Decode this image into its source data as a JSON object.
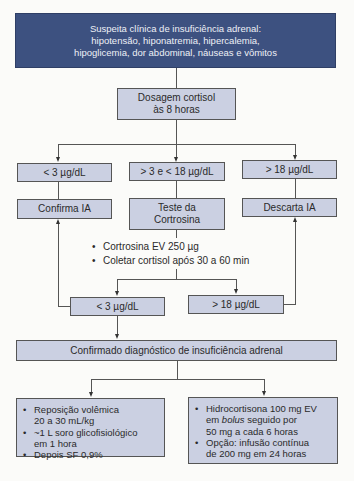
{
  "suspicion": {
    "line1": "Suspeita clínica de insuficiência adrenal:",
    "line2": "hipotensão, hiponatremia, hipercalemia,",
    "line3": "hipoglicemia, dor abdominal, náuseas e vômitos"
  },
  "cortisol_test": {
    "line1": "Dosagem cortisol",
    "line2": "às 8 horas"
  },
  "branches": {
    "low": "< 3 µg/dL",
    "mid": "> 3 e < 18 µg/dL",
    "high": "> 18 µg/dL"
  },
  "outcomes": {
    "confirm": "Confirma IA",
    "test_line1": "Teste da",
    "test_line2": "Cortrosina",
    "discard": "Descarta IA"
  },
  "stim_steps": [
    "Cortrosina EV 250 µg",
    "Coletar cortisol após 30 a 60 min"
  ],
  "stim_results": {
    "low": "< 3 µg/dL",
    "high": "> 18 µg/dL"
  },
  "confirmed": "Confirmado diagnóstico de insuficiência adrenal",
  "treatment_left": [
    {
      "l1": "Reposição volêmica",
      "l2": "20 a 30 mL/kg"
    },
    {
      "l1": "~1 L soro glicofisiológico",
      "l2": "em 1 hora"
    },
    {
      "l1": "Depois SF 0,9%",
      "l2": ""
    }
  ],
  "treatment_right": {
    "item1": {
      "a": "Hidrocortisona 100 mg EV",
      "b_pre": "em ",
      "b_em": "bolus",
      "b_post": " seguido por",
      "c": "50 mg a cada 6 horas"
    },
    "item2": {
      "a": "Opção: infusão contínua",
      "b": "de 200 mg em 24 horas"
    }
  }
}
